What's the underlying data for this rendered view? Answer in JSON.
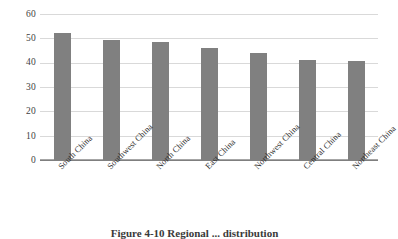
{
  "chart_data": {
    "type": "bar",
    "title": "",
    "xlabel": "",
    "ylabel": "",
    "categories": [
      "South China",
      "Southwest China",
      "North China",
      "East China",
      "Northwest China",
      "Central China",
      "Northeast China"
    ],
    "values": [
      52.2,
      49.2,
      48.5,
      45.9,
      43.9,
      41.2,
      40.5
    ],
    "ylim": [
      0,
      60
    ],
    "ytick_step": 10,
    "yticks": [
      "60",
      "50",
      "40",
      "30",
      "20",
      "10",
      "0"
    ],
    "grid": true,
    "legend": false,
    "bar_color": "#808080",
    "gridline_color": "#d9d9d9",
    "axis_color": "#7f7f7f"
  },
  "caption": {
    "text": "Figure 4-10  Regional ... distribution"
  }
}
